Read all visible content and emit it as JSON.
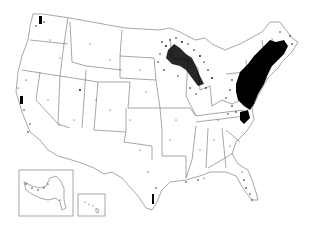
{
  "map": {
    "type": "dot-distribution",
    "region": "United States",
    "background": "#ffffff",
    "border_color": "#6b6b6b",
    "dot_color": "#000000",
    "insets": [
      {
        "name": "Alaska",
        "box": [
          19,
          170,
          54,
          46
        ]
      },
      {
        "name": "Hawaii",
        "box": [
          78,
          194,
          27,
          22
        ]
      }
    ],
    "density_regions": [
      {
        "name": "Northeast / Mid-Atlantic",
        "level": "very high",
        "cx": 262,
        "cy": 78,
        "rx": 24,
        "ry": 28
      },
      {
        "name": "New England",
        "level": "high",
        "cx": 285,
        "cy": 55,
        "rx": 14,
        "ry": 18
      },
      {
        "name": "Upper Midwest (MN/WI/MI)",
        "level": "high",
        "cx": 185,
        "cy": 60,
        "rx": 22,
        "ry": 20
      },
      {
        "name": "Chesapeake / Virginia",
        "level": "high",
        "cx": 245,
        "cy": 118,
        "rx": 6,
        "ry": 6
      },
      {
        "name": "Washington (Puget Sound)",
        "level": "medium",
        "cx": 41,
        "cy": 22,
        "rx": 3,
        "ry": 5
      },
      {
        "name": "California coast",
        "level": "medium",
        "cx": 22,
        "cy": 100,
        "rx": 3,
        "ry": 7
      },
      {
        "name": "Texas Gulf coast",
        "level": "low",
        "cx": 153,
        "cy": 200,
        "rx": 3,
        "ry": 9
      },
      {
        "name": "Florida",
        "level": "low",
        "cx": 248,
        "cy": 185,
        "rx": 6,
        "ry": 18
      }
    ]
  }
}
